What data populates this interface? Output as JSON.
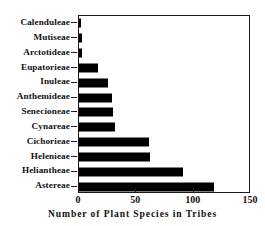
{
  "chart_data": {
    "type": "bar",
    "orientation": "horizontal",
    "title": "",
    "xlabel": "Number of Plant Species in Tribes",
    "ylabel": "",
    "xlim": [
      0,
      150
    ],
    "ylim": null,
    "xticks": [
      0,
      50,
      100,
      150
    ],
    "xticklabels": [
      "0",
      "50",
      "100",
      "150"
    ],
    "grid": false,
    "legend": null,
    "bar_color": "#000000",
    "frame_color": "#1a1a1a",
    "categories": [
      "Calenduleae",
      "Mutiseae",
      "Arctotideae",
      "Eupatorieae",
      "Inuleae",
      "Anthemideae",
      "Senecioneae",
      "Cynareae",
      "Cichorieae",
      "Helenieae",
      "Heliantheae",
      "Astereae"
    ],
    "values": [
      2,
      3,
      3,
      17,
      25,
      29,
      30,
      31,
      61,
      62,
      91,
      118
    ]
  },
  "axis": {
    "x_title": "Number of Plant Species in Tribes"
  }
}
